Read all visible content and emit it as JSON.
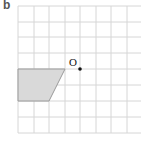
{
  "part_label": "b",
  "grid": {
    "x_lines": [
      18,
      34,
      49,
      65,
      80,
      96,
      111,
      127
    ],
    "y_lines": [
      6,
      22,
      37,
      53,
      69,
      85,
      101,
      117,
      133
    ],
    "x_extent": [
      18,
      141
    ],
    "y_extent": [
      6,
      133
    ],
    "line_color": "#d6d6d6"
  },
  "shape": {
    "name": "trapezium",
    "points": "18,69 65,69 49,101 18,101",
    "fill": "#d9d9d9",
    "stroke": "#9a9a9a"
  },
  "centre": {
    "label": "O",
    "x": 80,
    "y": 69,
    "label_x": 69,
    "label_y": 66,
    "color": "#111111"
  }
}
